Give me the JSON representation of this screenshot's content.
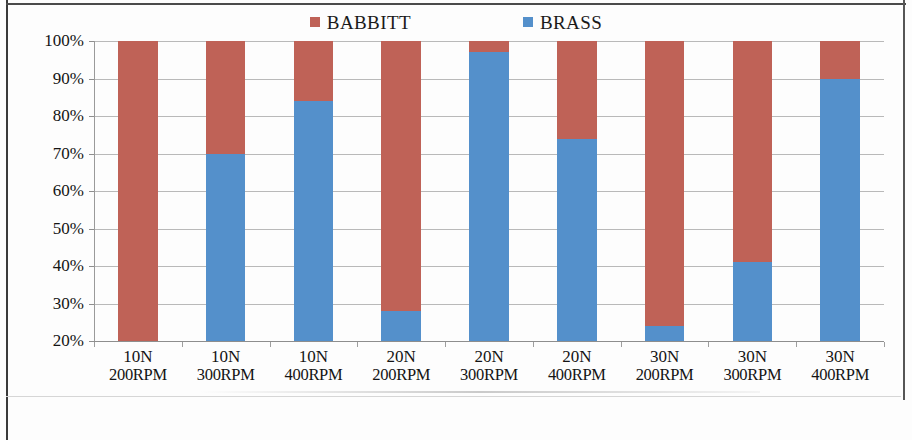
{
  "chart_data": {
    "type": "bar",
    "subtype": "100% stacked bar",
    "title": "",
    "xlabel": "",
    "ylabel": "",
    "ylim": [
      20,
      100
    ],
    "ytick_labels": [
      "100%",
      "90%",
      "80%",
      "70%",
      "60%",
      "50%",
      "40%",
      "30%",
      "20%"
    ],
    "ytick_values": [
      100,
      90,
      80,
      70,
      60,
      50,
      40,
      30,
      20
    ],
    "grid": true,
    "legend_position": "top-center",
    "categories": [
      "10N 200RPM",
      "10N 300RPM",
      "10N 400RPM",
      "20N 200RPM",
      "20N 300RPM",
      "20N 400RPM",
      "30N 200RPM",
      "30N 300RPM",
      "30N 400RPM"
    ],
    "category_lines": [
      {
        "line1": "10N",
        "line2": "200RPM"
      },
      {
        "line1": "10N",
        "line2": "300RPM"
      },
      {
        "line1": "10N",
        "line2": "400RPM"
      },
      {
        "line1": "20N",
        "line2": "200RPM"
      },
      {
        "line1": "20N",
        "line2": "300RPM"
      },
      {
        "line1": "20N",
        "line2": "400RPM"
      },
      {
        "line1": "30N",
        "line2": "200RPM"
      },
      {
        "line1": "30N",
        "line2": "300RPM"
      },
      {
        "line1": "30N",
        "line2": "400RPM"
      }
    ],
    "series": [
      {
        "name": "BABBITT",
        "color": "#BF6257",
        "values": [
          81,
          30,
          16,
          72,
          3,
          26,
          76,
          59,
          10
        ]
      },
      {
        "name": "BRASS",
        "color": "#5490CB",
        "values": [
          19,
          70,
          84,
          28,
          97,
          74,
          24,
          41,
          90
        ]
      }
    ]
  },
  "legend": {
    "entries": [
      {
        "label": "BABBITT",
        "color": "#BF6257",
        "marker": "square-marker"
      },
      {
        "label": "BRASS",
        "color": "#5490CB",
        "marker": "square-marker"
      }
    ]
  },
  "axis": {
    "y_ticks": [
      {
        "label": "100%",
        "value": 100
      },
      {
        "label": "90%",
        "value": 90
      },
      {
        "label": "80%",
        "value": 80
      },
      {
        "label": "70%",
        "value": 70
      },
      {
        "label": "60%",
        "value": 60
      },
      {
        "label": "50%",
        "value": 50
      },
      {
        "label": "40%",
        "value": 40
      },
      {
        "label": "30%",
        "value": 30
      },
      {
        "label": "20%",
        "value": 20
      }
    ]
  },
  "colors": {
    "babbitt": "#BF6257",
    "brass": "#5490CB",
    "gridline": "#b9b9b9",
    "axis": "#8e8e8e",
    "text": "#141414",
    "page_background": "#fdfdfd",
    "frame": "#3a3a3a"
  }
}
